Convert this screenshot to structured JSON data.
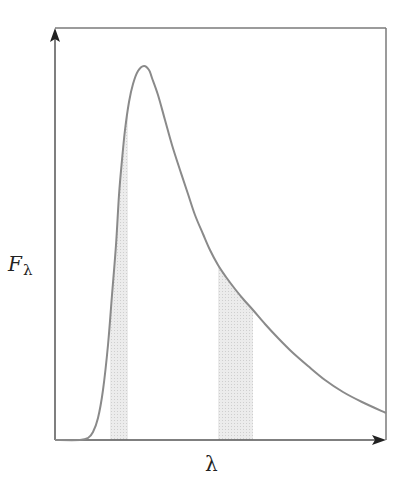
{
  "chart_data": {
    "type": "line",
    "title": "",
    "xlabel": "λ",
    "ylabel": "F",
    "ylabel_subscript": "λ",
    "grid": false,
    "legend": null,
    "axis_ticks": "none",
    "series": [
      {
        "name": "F_lambda",
        "color": "#8a8a8a",
        "points_px": [
          [
            55,
            440
          ],
          [
            80,
            440
          ],
          [
            88,
            438
          ],
          [
            93,
            432
          ],
          [
            98,
            418
          ],
          [
            103,
            390
          ],
          [
            108,
            345
          ],
          [
            112,
            295
          ],
          [
            116,
            245
          ],
          [
            119,
            195
          ],
          [
            122,
            160
          ],
          [
            125,
            130
          ],
          [
            129,
            102
          ],
          [
            133,
            84
          ],
          [
            138,
            71
          ],
          [
            144,
            66
          ],
          [
            149,
            70
          ],
          [
            152,
            78
          ],
          [
            158,
            95
          ],
          [
            165,
            120
          ],
          [
            172,
            145
          ],
          [
            180,
            170
          ],
          [
            188,
            194
          ],
          [
            195,
            215
          ],
          [
            203,
            234
          ],
          [
            210,
            250
          ],
          [
            218,
            265
          ],
          [
            226,
            277
          ],
          [
            235,
            289
          ],
          [
            244,
            300
          ],
          [
            253,
            310
          ],
          [
            265,
            324
          ],
          [
            278,
            338
          ],
          [
            292,
            352
          ],
          [
            308,
            366
          ],
          [
            325,
            380
          ],
          [
            343,
            392
          ],
          [
            362,
            402
          ],
          [
            386,
            413
          ]
        ]
      }
    ],
    "shaded_bands": [
      {
        "name": "band-1",
        "x_start_px": 110,
        "x_end_px": 128,
        "color": "#dcdcdc"
      },
      {
        "name": "band-2",
        "x_start_px": 218,
        "x_end_px": 253,
        "color": "#dcdcdc"
      }
    ],
    "frame": {
      "left": 55,
      "top": 28,
      "right": 386,
      "bottom": 440
    },
    "axis_color": "#222222",
    "frame_color": "#7a7a7a"
  }
}
